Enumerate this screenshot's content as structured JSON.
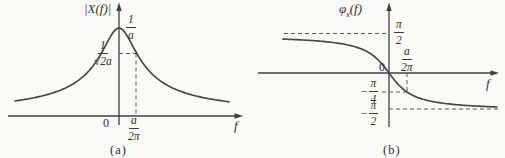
{
  "figure": {
    "panel_a": {
      "y_axis_label": "|X(f)|",
      "x_axis_label": "f",
      "origin": "0",
      "peak_frac": {
        "num": "1",
        "den": "a"
      },
      "half_frac": {
        "num": "1",
        "den": "√2a"
      },
      "tick_frac": {
        "num": "a",
        "den": "2π"
      },
      "caption": "(a)"
    },
    "panel_b": {
      "y_label_phi": "φ",
      "y_label_sub": "x",
      "y_label_rest": "(f)",
      "x_axis_label": "f",
      "origin": "0",
      "pos_half_pi": {
        "num": "π",
        "den": "2"
      },
      "tick_frac": {
        "num": "a",
        "den": "2π"
      },
      "neg_quarter_pi": {
        "sign": "−",
        "num": "π",
        "den": "4"
      },
      "neg_half_pi": {
        "sign": "−",
        "num": "π",
        "den": "2"
      },
      "caption": "(b)"
    }
  },
  "chart_data": [
    {
      "type": "line",
      "panel": "a",
      "title": "|X(f)| magnitude spectrum",
      "xlabel": "f",
      "ylabel": "|X(f)|",
      "function": "|X(f)| = 1 / sqrt(a^2 + (2πf)^2)",
      "x_units": "multiples of a/2π",
      "y_units": "multiples of 1/a",
      "x": [
        -5.8,
        -5,
        -4,
        -3,
        -2,
        -1.5,
        -1,
        -0.5,
        0,
        0.5,
        1,
        1.5,
        2,
        3,
        4,
        5,
        6.2
      ],
      "y": [
        0.17,
        0.2,
        0.24,
        0.32,
        0.45,
        0.55,
        0.71,
        0.89,
        1.0,
        0.89,
        0.71,
        0.55,
        0.45,
        0.32,
        0.24,
        0.2,
        0.16
      ],
      "key_points": [
        {
          "f": "0",
          "value": "1/a",
          "note": "peak at origin"
        },
        {
          "f": "a/2π",
          "value": "1/(√2·a)",
          "note": "half-power point marked with dashed lines"
        }
      ],
      "grid": "off",
      "legend": "none"
    },
    {
      "type": "line",
      "panel": "b",
      "title": "φx(f) phase spectrum",
      "xlabel": "f",
      "ylabel": "φx(f)",
      "function": "φx(f) = −arctan(2πf / a)",
      "x_units": "multiples of a/2π",
      "y_units": "radians",
      "x": [
        -5.9,
        -5,
        -4,
        -3,
        -2,
        -1,
        -0.5,
        0,
        0.5,
        1,
        2,
        3,
        4,
        5,
        6
      ],
      "y": [
        1.4,
        1.37,
        1.33,
        1.25,
        1.11,
        0.79,
        0.46,
        0,
        -0.46,
        -0.79,
        -1.11,
        -1.25,
        -1.33,
        -1.37,
        -1.41
      ],
      "asymptotes": [
        "π/2 as f → −∞ (dashed)",
        "−π/2 as f → +∞ (dashed)"
      ],
      "key_points": [
        {
          "f": "0",
          "value": "0"
        },
        {
          "f": "a/2π",
          "value": "−π/4",
          "note": "marked with dashed lines"
        }
      ],
      "grid": "off",
      "legend": "none"
    }
  ]
}
